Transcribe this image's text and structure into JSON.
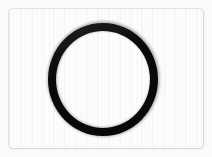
{
  "image": {
    "kind": "scanned-photograph",
    "subject": "o-ring",
    "caption": "Black rubber O-ring gasket photographed on a white background",
    "width": 212,
    "height": 157
  },
  "card": {
    "label": "scan-card",
    "background_color": "#fdfdfd",
    "border_color": "#cdcdcd",
    "left": 9,
    "top": 9,
    "width": 194,
    "height": 139,
    "corner_radius": 4
  },
  "backdrop": {
    "label": "page-backdrop",
    "color": "#fbfbfb"
  },
  "object": {
    "name": "o-ring",
    "shape": "annulus",
    "color": "#0a0a0a",
    "center_x": 103,
    "center_y": 79,
    "outer_width": 110,
    "outer_height": 113,
    "stroke_width": 8,
    "interior_color": "#fdfdfd"
  },
  "texture": {
    "name": "vertical-scan-lines",
    "visible": true,
    "tone": "rgba(0,0,0,0.02)"
  }
}
